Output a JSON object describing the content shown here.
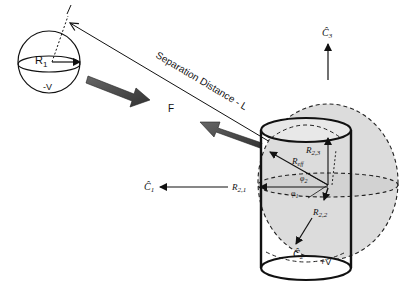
{
  "diagram": {
    "sphere_left": {
      "radius_label": "R",
      "radius_sub": "1",
      "charge_label": "-V"
    },
    "separation_label": "Separation Distance - L",
    "force_label": "F",
    "cylinder": {
      "charge_label": "+V",
      "r_eff_label": "R",
      "r_eff_sub": "eff",
      "phi1_label": "φ",
      "phi1_sub": "1",
      "phi2_label": "φ",
      "phi2_sub": "2",
      "r21_label": "R",
      "r21_sub": "2,1",
      "r22_label": "R",
      "r22_sub": "2,2",
      "r23_label": "R",
      "r23_sub": "2,3"
    },
    "axes": {
      "c1_label": "Ĉ",
      "c1_sub": "1",
      "c2_label": "Ĉ",
      "c2_sub": "2",
      "c3_label": "Ĉ",
      "c3_sub": "3"
    },
    "colors": {
      "line": "#111111",
      "force_arrow": "#4a4a4a",
      "ellipsoid_fill": "#dcdcdc",
      "background": "#ffffff"
    }
  }
}
